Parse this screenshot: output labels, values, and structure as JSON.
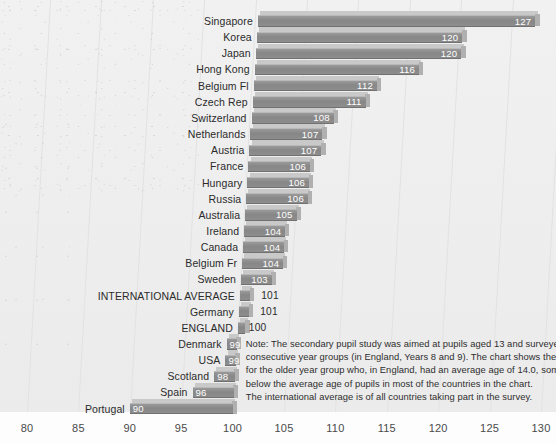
{
  "chart_data": {
    "type": "bar",
    "orientation": "horizontal",
    "title": "",
    "xlabel": "",
    "ylabel": "",
    "xlim": [
      80,
      130
    ],
    "xticks": [
      80,
      85,
      90,
      95,
      100,
      105,
      110,
      115,
      120,
      125,
      130
    ],
    "baseline": 100,
    "grid": true,
    "legend": "none",
    "categories": [
      "Singapore",
      "Korea",
      "Japan",
      "Hong Kong",
      "Belgium Fl",
      "Czech Rep",
      "Switzerland",
      "Netherlands",
      "Austria",
      "France",
      "Hungary",
      "Russia",
      "Australia",
      "Ireland",
      "Canada",
      "Belgium Fr",
      "Sweden",
      "INTERNATIONAL AVERAGE",
      "Germany",
      "ENGLAND",
      "Denmark",
      "USA",
      "Scotland",
      "Spain",
      "Portugal"
    ],
    "values": [
      127,
      120,
      120,
      116,
      112,
      111,
      108,
      107,
      107,
      106,
      106,
      106,
      105,
      104,
      104,
      104,
      103,
      101,
      101,
      100,
      99,
      99,
      98,
      96,
      90
    ],
    "bars": [
      {
        "label": "Singapore",
        "value": 127,
        "value_text": "127",
        "label_inside": true
      },
      {
        "label": "Korea",
        "value": 120,
        "value_text": "120",
        "label_inside": true
      },
      {
        "label": "Japan",
        "value": 120,
        "value_text": "120",
        "label_inside": true
      },
      {
        "label": "Hong Kong",
        "value": 116,
        "value_text": "116",
        "label_inside": true
      },
      {
        "label": "Belgium Fl",
        "value": 112,
        "value_text": "112",
        "label_inside": true
      },
      {
        "label": "Czech Rep",
        "value": 111,
        "value_text": "111",
        "label_inside": true
      },
      {
        "label": "Switzerland",
        "value": 108,
        "value_text": "108",
        "label_inside": true
      },
      {
        "label": "Netherlands",
        "value": 107,
        "value_text": "107",
        "label_inside": true
      },
      {
        "label": "Austria",
        "value": 107,
        "value_text": "107",
        "label_inside": true
      },
      {
        "label": "France",
        "value": 106,
        "value_text": "106",
        "label_inside": true
      },
      {
        "label": "Hungary",
        "value": 106,
        "value_text": "106",
        "label_inside": true
      },
      {
        "label": "Russia",
        "value": 106,
        "value_text": "106",
        "label_inside": true
      },
      {
        "label": "Australia",
        "value": 105,
        "value_text": "105",
        "label_inside": true
      },
      {
        "label": "Ireland",
        "value": 104,
        "value_text": "104",
        "label_inside": true
      },
      {
        "label": "Canada",
        "value": 104,
        "value_text": "104",
        "label_inside": true
      },
      {
        "label": "Belgium Fr",
        "value": 104,
        "value_text": "104",
        "label_inside": true
      },
      {
        "label": "Sweden",
        "value": 103,
        "value_text": "103",
        "label_inside": true
      },
      {
        "label": "INTERNATIONAL AVERAGE",
        "value": 101,
        "value_text": "101",
        "label_inside": false
      },
      {
        "label": "Germany",
        "value": 101,
        "value_text": "101",
        "label_inside": false
      },
      {
        "label": "ENGLAND",
        "value": 100,
        "value_text": "100",
        "label_inside": false
      },
      {
        "label": "Denmark",
        "value": 99,
        "value_text": "99",
        "label_inside": true
      },
      {
        "label": "USA",
        "value": 99,
        "value_text": "99",
        "label_inside": true
      },
      {
        "label": "Scotland",
        "value": 98,
        "value_text": "98",
        "label_inside": true
      },
      {
        "label": "Spain",
        "value": 96,
        "value_text": "96",
        "label_inside": true
      },
      {
        "label": "Portugal",
        "value": 90,
        "value_text": "90",
        "label_inside": true
      }
    ],
    "note_lines": [
      "Note: The secondary pupil study was aimed at pupils aged 13 and surveyed two",
      "consecutive year groups (in England, Years 8 and 9). The chart shows the results",
      "for the older year group who, in England, had an average age of 14.0, somewhat",
      "below the average age of pupils in most of the countries in the chart.",
      "The international average is of all countries taking part in the survey."
    ],
    "colors": {
      "bar_fill": "#8d8d8d",
      "bar_top": "#c9c9c9",
      "bar_side": "#b0b0b0",
      "plot_background": "#eeeeee",
      "gridline": "#e2e2e2",
      "label_text": "#2b2b2b",
      "value_text_inside": "#ffffff",
      "value_text_outside": "#2b2b2b"
    }
  }
}
